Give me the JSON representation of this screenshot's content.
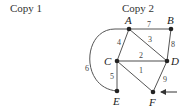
{
  "captions": {
    "copy1": "Copy 1",
    "copy2": "Copy 2"
  },
  "graph": {
    "nodes": [
      {
        "id": "A",
        "label": "A",
        "x": 129,
        "y": 29
      },
      {
        "id": "B",
        "label": "B",
        "x": 171,
        "y": 29
      },
      {
        "id": "C",
        "label": "C",
        "x": 117,
        "y": 61
      },
      {
        "id": "D",
        "label": "D",
        "x": 167,
        "y": 61
      },
      {
        "id": "E",
        "label": "E",
        "x": 117,
        "y": 91
      },
      {
        "id": "F",
        "label": "F",
        "x": 153,
        "y": 92
      }
    ],
    "edges": [
      {
        "from": "A",
        "to": "B",
        "weight": "7"
      },
      {
        "from": "A",
        "to": "C",
        "weight": "4"
      },
      {
        "from": "A",
        "to": "D",
        "weight": "3"
      },
      {
        "from": "B",
        "to": "D",
        "weight": "8"
      },
      {
        "from": "C",
        "to": "D",
        "weight": "2"
      },
      {
        "from": "C",
        "to": "F",
        "weight": "1"
      },
      {
        "from": "C",
        "to": "E",
        "weight": "5"
      },
      {
        "from": "D",
        "to": "F",
        "weight": "9"
      },
      {
        "from": "A",
        "to": "E",
        "weight": "6",
        "curved": true
      }
    ],
    "start_arrow_target": "F"
  }
}
